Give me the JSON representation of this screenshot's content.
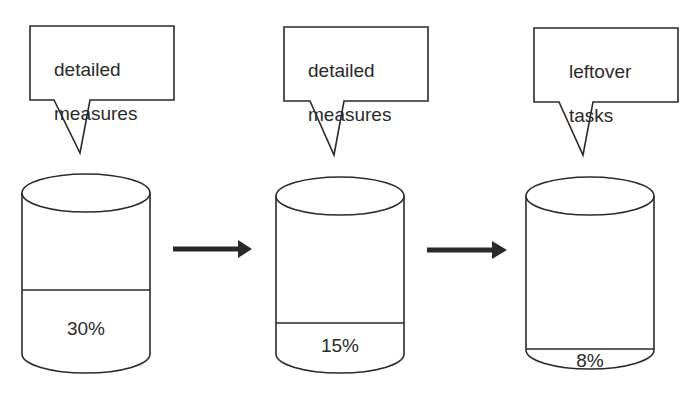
{
  "diagram": {
    "stages": [
      {
        "callout_line1": "detailed",
        "callout_line2": "measures",
        "fill_percent": "30%",
        "fill_value": 30
      },
      {
        "callout_line1": "detailed",
        "callout_line2": "measures",
        "fill_percent": "15%",
        "fill_value": 15
      },
      {
        "callout_line1": "leftover",
        "callout_line2": "tasks",
        "fill_percent": "8%",
        "fill_value": 8
      }
    ],
    "arrows": [
      {
        "from": 0,
        "to": 1
      },
      {
        "from": 1,
        "to": 2
      }
    ],
    "colors": {
      "stroke": "#2a2a2a",
      "background": "#ffffff"
    }
  }
}
